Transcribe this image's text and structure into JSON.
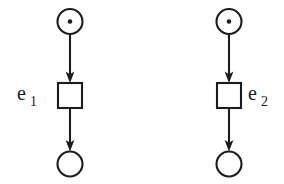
{
  "diagram": {
    "type": "petri-net",
    "title": "",
    "background_color": "#ffffff",
    "stroke_color": "#1c1c1c",
    "fill_color": "#ffffff",
    "nets": [
      {
        "id": "net-left",
        "label": "e",
        "label_subscript": "1",
        "label_position": "left",
        "places": [
          {
            "id": "place-left-input",
            "role": "input-place",
            "tokens": 1,
            "cx": 70,
            "cy": 21.5,
            "r": 12.5
          },
          {
            "id": "place-left-output",
            "role": "output-place",
            "tokens": 0,
            "cx": 70,
            "cy": 164,
            "r": 12.5
          }
        ],
        "transitions": [
          {
            "id": "transition-left",
            "x": 58,
            "y": 83,
            "width": 24,
            "height": 25
          }
        ],
        "arcs": [
          {
            "id": "arc-left-in",
            "from": "place-left-input",
            "to": "transition-left",
            "x": 70,
            "y1": 34,
            "y2": 83
          },
          {
            "id": "arc-left-out",
            "from": "transition-left",
            "to": "place-left-output",
            "x": 70,
            "y1": 108,
            "y2": 151.5
          }
        ]
      },
      {
        "id": "net-right",
        "label": "e",
        "label_subscript": "2",
        "label_position": "right",
        "places": [
          {
            "id": "place-right-input",
            "role": "input-place",
            "tokens": 1,
            "cx": 229,
            "cy": 21.5,
            "r": 12.5
          },
          {
            "id": "place-right-output",
            "role": "output-place",
            "tokens": 0,
            "cx": 229,
            "cy": 164,
            "r": 12.5
          }
        ],
        "transitions": [
          {
            "id": "transition-right",
            "x": 217,
            "y": 83,
            "width": 24,
            "height": 25
          }
        ],
        "arcs": [
          {
            "id": "arc-right-in",
            "from": "place-right-input",
            "to": "transition-right",
            "x": 229,
            "y1": 34,
            "y2": 83
          },
          {
            "id": "arc-right-out",
            "from": "transition-right",
            "to": "place-right-output",
            "x": 229,
            "y1": 108,
            "y2": 151.5
          }
        ]
      }
    ],
    "labels": {
      "left_base": "e",
      "left_sub": "1",
      "right_base": "e",
      "right_sub": "2"
    }
  }
}
